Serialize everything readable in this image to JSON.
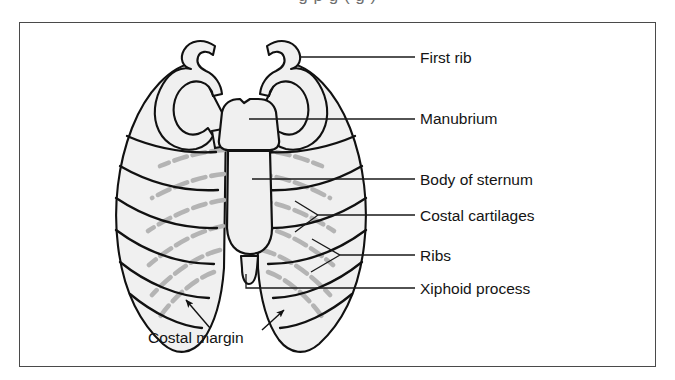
{
  "figure": {
    "type": "anatomical-diagram",
    "caption_remnant": "g   p     g  (  g     )",
    "frame_color": "#4a4a4a",
    "background_color": "#ffffff"
  },
  "colors": {
    "bone_outline": "#111111",
    "bone_fill": "#f0f0f0",
    "cartilage_gray": "#b4b4b4",
    "leader_line": "#1a1a1a",
    "label_text": "#141414",
    "frame": "#4a4a4a"
  },
  "labels": [
    {
      "id": "first-rib",
      "text": "First rib",
      "x": 420,
      "y": 50,
      "leader": "horizontal"
    },
    {
      "id": "manubrium",
      "text": "Manubrium",
      "x": 420,
      "y": 111,
      "leader": "horizontal"
    },
    {
      "id": "body-of-sternum",
      "text": "Body of sternum",
      "x": 420,
      "y": 172,
      "leader": "horizontal"
    },
    {
      "id": "costal-cartilages",
      "text": "Costal cartilages",
      "x": 420,
      "y": 209,
      "leader": "forked"
    },
    {
      "id": "ribs",
      "text": "Ribs",
      "x": 420,
      "y": 249,
      "leader": "forked"
    },
    {
      "id": "xiphoid-process",
      "text": "Xiphoid process",
      "x": 420,
      "y": 281,
      "leader": "elbow"
    },
    {
      "id": "costal-margin",
      "text": "Costal margin",
      "x": 148,
      "y": 330,
      "leader": "double-arrow"
    }
  ],
  "structures": {
    "ribs_count_per_side": 7,
    "first_rib": "hooked curved bone at top of thorax",
    "manubrium": "upper broad segment of sternum",
    "body_of_sternum": "long central segment of sternum",
    "xiphoid_process": "small pointed inferior tip of sternum",
    "costal_cartilages": "gray dashed bands joining ribs to sternum",
    "costal_margin": "inferior border formed by lower costal cartilages"
  }
}
